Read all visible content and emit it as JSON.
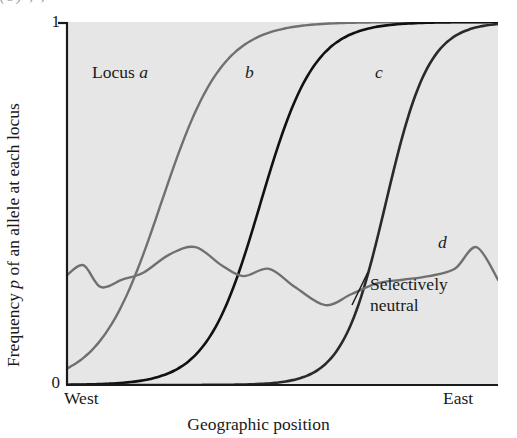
{
  "figure": {
    "caption_remnant": "(b)   ,   ,",
    "background_color": "#e6e6e6",
    "axis_color": "#1a1a1a"
  },
  "axes": {
    "y_title_pre": "Frequency ",
    "y_title_italic": "p",
    "y_title_post": " of an allele at each locus",
    "y_ticks": [
      "1",
      "0"
    ],
    "y_tick_top": "1",
    "y_tick_bottom": "0",
    "x_title": "Geographic position",
    "x_start_label": "West",
    "x_end_label": "East"
  },
  "annotations": {
    "locus_a_prefix": "Locus ",
    "locus_a": "a",
    "locus_b": "b",
    "locus_c": "c",
    "locus_d": "d",
    "neutral_line1": "Selectively",
    "neutral_line2": "neutral"
  },
  "chart_data": {
    "type": "line",
    "title": "",
    "xlabel": "Geographic position",
    "ylabel": "Frequency p of an allele at each locus",
    "xlim": [
      0,
      1
    ],
    "ylim": [
      0,
      1
    ],
    "x_tick_labels": [
      "West",
      "East"
    ],
    "y_tick_labels": [
      "0",
      "1"
    ],
    "grid": false,
    "legend": "inline-curve-labels",
    "series": [
      {
        "name": "Locus a",
        "label": "a",
        "color": "#707070",
        "width": 2.4,
        "shape": "sigmoid",
        "midpoint": 0.22,
        "steepness": 14,
        "x": [
          0.0,
          0.05,
          0.1,
          0.14,
          0.18,
          0.22,
          0.26,
          0.3,
          0.34,
          0.38,
          0.45,
          0.55,
          0.7,
          0.85,
          1.0
        ],
        "y": [
          0.02,
          0.05,
          0.11,
          0.22,
          0.4,
          0.6,
          0.77,
          0.88,
          0.94,
          0.97,
          0.99,
          1.0,
          1.0,
          1.0,
          1.0
        ]
      },
      {
        "name": "Locus b",
        "label": "b",
        "color": "#111111",
        "width": 2.6,
        "shape": "sigmoid",
        "midpoint": 0.45,
        "steepness": 16,
        "x": [
          0.0,
          0.1,
          0.2,
          0.26,
          0.32,
          0.38,
          0.44,
          0.5,
          0.56,
          0.62,
          0.7,
          0.8,
          0.9,
          1.0
        ],
        "y": [
          0.0,
          0.01,
          0.02,
          0.05,
          0.13,
          0.3,
          0.52,
          0.73,
          0.88,
          0.95,
          0.99,
          1.0,
          1.0,
          1.0
        ]
      },
      {
        "name": "Locus c",
        "label": "c",
        "color": "#2a2a2a",
        "width": 2.6,
        "shape": "sigmoid",
        "midpoint": 0.74,
        "steepness": 20,
        "x": [
          0.0,
          0.2,
          0.4,
          0.52,
          0.6,
          0.66,
          0.72,
          0.78,
          0.84,
          0.9,
          1.0
        ],
        "y": [
          0.0,
          0.0,
          0.01,
          0.03,
          0.09,
          0.25,
          0.52,
          0.8,
          0.94,
          0.99,
          1.0
        ]
      },
      {
        "name": "Selectively neutral",
        "label": "d",
        "color": "#707070",
        "width": 2.4,
        "shape": "wiggly",
        "x": [
          0.0,
          0.04,
          0.08,
          0.13,
          0.18,
          0.24,
          0.3,
          0.36,
          0.41,
          0.47,
          0.53,
          0.6,
          0.66,
          0.72,
          0.78,
          0.84,
          0.9,
          0.95,
          1.0
        ],
        "y": [
          0.3,
          0.33,
          0.27,
          0.29,
          0.31,
          0.36,
          0.38,
          0.33,
          0.3,
          0.32,
          0.27,
          0.22,
          0.25,
          0.28,
          0.29,
          0.3,
          0.32,
          0.38,
          0.29
        ]
      }
    ]
  }
}
